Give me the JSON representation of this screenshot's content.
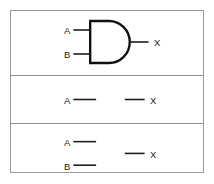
{
  "figure": {
    "background_color": "#ffffff",
    "frame_border_color": "#9a9a9a",
    "ink_color": "#111111"
  },
  "panels": [
    {
      "id": "panel-and-gate",
      "name": "and-gate-panel",
      "gate": {
        "type": "AND",
        "symbol_style": "distinctive-shape",
        "filled": false
      },
      "inputs": [
        {
          "label": "A",
          "name": "input-a"
        },
        {
          "label": "B",
          "name": "input-b"
        }
      ],
      "outputs": [
        {
          "label": "X",
          "name": "output-x"
        }
      ]
    },
    {
      "id": "panel-blank-one-input",
      "name": "blank-one-input-panel",
      "gate": {
        "type": "",
        "symbol_style": "blank",
        "filled": false
      },
      "inputs": [
        {
          "label": "A",
          "name": "input-a"
        }
      ],
      "outputs": [
        {
          "label": "X",
          "name": "output-x"
        }
      ]
    },
    {
      "id": "panel-blank-two-input",
      "name": "blank-two-input-panel",
      "gate": {
        "type": "",
        "symbol_style": "blank",
        "filled": false
      },
      "inputs": [
        {
          "label": "A",
          "name": "input-a"
        },
        {
          "label": "B",
          "name": "input-b"
        }
      ],
      "outputs": [
        {
          "label": "X",
          "name": "output-x"
        }
      ]
    }
  ]
}
